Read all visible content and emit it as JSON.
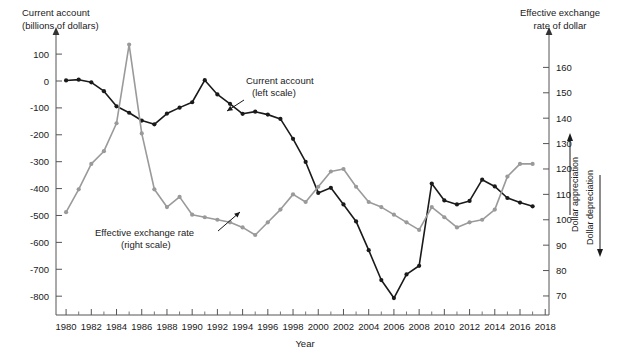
{
  "chart_data": {
    "type": "line",
    "title": "",
    "xlabel": "Year",
    "left_axis": {
      "label_line1": "Current account",
      "label_line2": "(billions of dollars)",
      "ticks": [
        100,
        0,
        -100,
        -200,
        -300,
        -400,
        -500,
        -600,
        -700,
        -800
      ],
      "tick_labels": [
        "100",
        "0",
        "-100",
        "-200",
        "-300",
        "-400",
        "-500",
        "-600",
        "-700",
        "-800"
      ],
      "ylim": [
        -870,
        145
      ]
    },
    "right_axis": {
      "label_line1": "Effective exchange",
      "label_line2": "rate of dollar",
      "ticks": [
        160,
        150,
        140,
        130,
        120,
        110,
        100,
        90,
        80,
        70
      ],
      "tick_labels": [
        "160",
        "150",
        "140",
        "130",
        "120",
        "110",
        "100",
        "90",
        "80",
        "70"
      ],
      "ylim": [
        62.5,
        170
      ],
      "direction_up": "Dollar appreciation",
      "direction_down": "Dollar depreciation"
    },
    "x": [
      1980,
      1981,
      1982,
      1983,
      1984,
      1985,
      1986,
      1987,
      1988,
      1989,
      1990,
      1991,
      1992,
      1993,
      1994,
      1995,
      1996,
      1997,
      1998,
      1999,
      2000,
      2001,
      2002,
      2003,
      2004,
      2005,
      2006,
      2007,
      2008,
      2009,
      2010,
      2011,
      2012,
      2013,
      2014,
      2015,
      2016,
      2017
    ],
    "xlim": [
      1979.2,
      2018.3
    ],
    "xticks": [
      1980,
      1982,
      1984,
      1986,
      1988,
      1990,
      1992,
      1994,
      1996,
      1998,
      2000,
      2002,
      2004,
      2006,
      2008,
      2010,
      2012,
      2014,
      2016,
      2018
    ],
    "xtick_labels": [
      "1980",
      "1982",
      "1984",
      "1986",
      "1988",
      "1990",
      "1992",
      "1994",
      "1996",
      "1998",
      "2000",
      "2002",
      "2004",
      "2006",
      "2008",
      "2010",
      "2012",
      "2014",
      "2016",
      "2018"
    ],
    "x_minor_ticks": [
      1981,
      1983,
      1985,
      1987,
      1989,
      1991,
      1993,
      1995,
      1997,
      1999,
      2001,
      2003,
      2005,
      2007,
      2009,
      2011,
      2013,
      2015,
      2017
    ],
    "grid": false,
    "legend": "annotations",
    "series": [
      {
        "name": "Current account",
        "scale": "left",
        "color": "#1a1a1a",
        "annotation_line1": "Current account",
        "annotation_line2": "(left scale)",
        "values": [
          2,
          5,
          -5,
          -38,
          -94,
          -118,
          -147,
          -161,
          -121,
          -99,
          -79,
          3,
          -50,
          -85,
          -122,
          -114,
          -125,
          -141,
          -215,
          -301,
          -416,
          -397,
          -459,
          -522,
          -629,
          -740,
          -807,
          -719,
          -687,
          -381,
          -444,
          -459,
          -446,
          -367,
          -392,
          -435,
          -452,
          -466
        ]
      },
      {
        "name": "Effective exchange rate",
        "scale": "right",
        "color": "#9a9a9a",
        "annotation_line1": "Effective exchange rate",
        "annotation_line2": "(right scale)",
        "values": [
          103,
          112,
          122,
          127,
          138,
          169,
          134,
          112,
          105,
          109,
          102,
          101,
          100,
          99,
          97,
          94,
          99,
          104,
          110,
          107,
          113,
          119,
          120,
          113,
          107,
          105,
          102,
          99,
          96,
          105,
          101,
          97,
          99,
          100,
          104,
          117,
          122,
          122
        ]
      }
    ]
  }
}
